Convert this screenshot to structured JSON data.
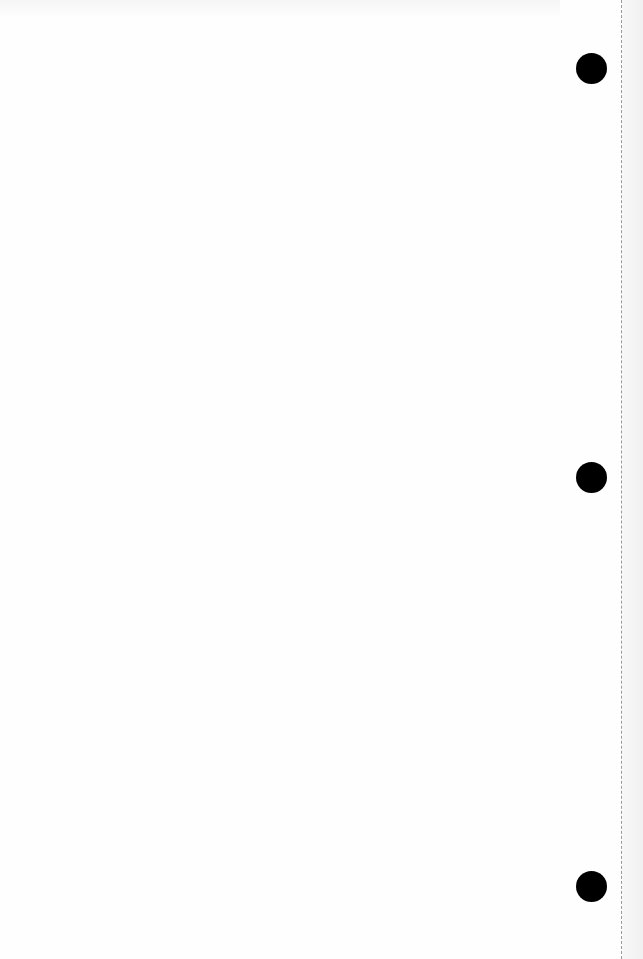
{
  "document": {
    "type": "blank scanned page",
    "binder_holes": 3,
    "content": ""
  }
}
